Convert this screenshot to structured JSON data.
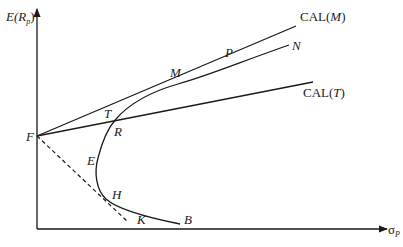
{
  "diagram": {
    "type": "efficient-frontier-capital-allocation",
    "axes": {
      "y_label_main": "E(R",
      "y_label_sub": "p",
      "y_label_close": ")",
      "x_label_main": "σ",
      "x_label_sub": "P"
    },
    "lines": {
      "cal_m": {
        "prefix": "CAL(",
        "var": "M",
        "suffix": ")"
      },
      "cal_t": {
        "prefix": "CAL(",
        "var": "T",
        "suffix": ")"
      },
      "n_label": "N"
    },
    "points": {
      "F": "F",
      "T": "T",
      "R": "R",
      "M": "M",
      "P": "P",
      "E": "E",
      "H": "H",
      "K": "K",
      "B": "B"
    },
    "colors": {
      "ink": "#1a1a1a",
      "background": "#ffffff"
    }
  }
}
